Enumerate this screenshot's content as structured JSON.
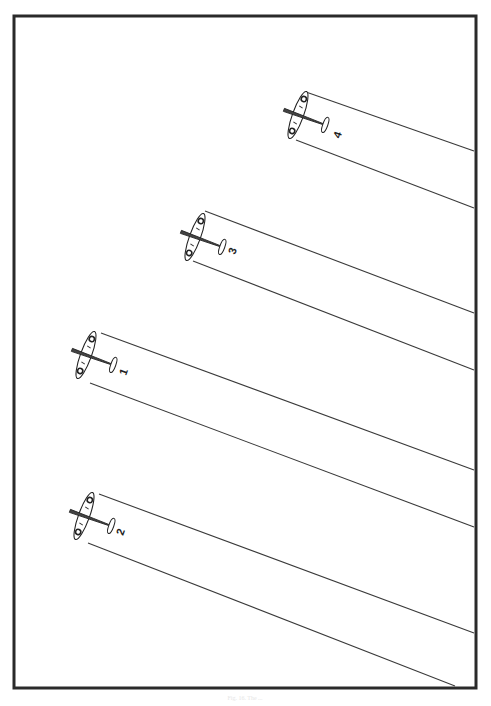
{
  "figure": {
    "frame": {
      "x": 14,
      "y": 16,
      "width": 462,
      "height": 672,
      "color": "#2a2a2a"
    },
    "caption": "Fig. 16. The ...",
    "aircraft": [
      {
        "id": "4",
        "label": "4",
        "cx": 298,
        "cy": 115,
        "beam_top": {
          "x1": 306,
          "y1": 92,
          "x2": 474,
          "y2": 151
        },
        "beam_bottom": {
          "x1": 296,
          "y1": 140,
          "x2": 474,
          "y2": 208
        },
        "label_pos": {
          "x": 341,
          "y": 136
        }
      },
      {
        "id": "3",
        "label": "3",
        "cx": 195,
        "cy": 237,
        "beam_top": {
          "x1": 205,
          "y1": 211,
          "x2": 474,
          "y2": 313
        },
        "beam_bottom": {
          "x1": 193,
          "y1": 261,
          "x2": 474,
          "y2": 370
        },
        "label_pos": {
          "x": 236,
          "y": 252
        }
      },
      {
        "id": "1",
        "label": "1",
        "cx": 86,
        "cy": 355,
        "beam_top": {
          "x1": 101,
          "y1": 333,
          "x2": 474,
          "y2": 470
        },
        "beam_bottom": {
          "x1": 90,
          "y1": 383,
          "x2": 474,
          "y2": 527
        },
        "label_pos": {
          "x": 127,
          "y": 373
        }
      },
      {
        "id": "2",
        "label": "2",
        "cx": 84,
        "cy": 516,
        "beam_top": {
          "x1": 99,
          "y1": 494,
          "x2": 474,
          "y2": 633
        },
        "beam_bottom": {
          "x1": 88,
          "y1": 543,
          "x2": 455,
          "y2": 686
        },
        "label_pos": {
          "x": 124,
          "y": 533
        }
      }
    ]
  }
}
